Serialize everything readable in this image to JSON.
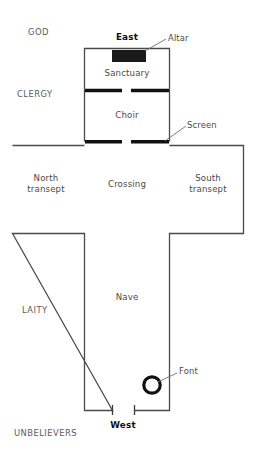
{
  "diagram": {
    "type": "church-floor-plan",
    "title_absent": true,
    "colors": {
      "background": "#ffffff",
      "wall_stroke": "#4a4a4a",
      "solid_fill": "#1a1a1a",
      "text": "#4a4a4a",
      "leader": "#6e6e6e"
    },
    "compass": {
      "east_label": "East",
      "west_label": "West"
    },
    "zones": [
      {
        "id": "god",
        "label": "GOD"
      },
      {
        "id": "clergy",
        "label": "CLERGY"
      },
      {
        "id": "laity",
        "label": "LAITY"
      },
      {
        "id": "unbelievers",
        "label": "UNBELIEVERS"
      }
    ],
    "rooms": [
      {
        "id": "sanctuary",
        "label": "Sanctuary"
      },
      {
        "id": "choir",
        "label": "Choir"
      },
      {
        "id": "crossing",
        "label": "Crossing"
      },
      {
        "id": "north-transept",
        "label_line1": "North",
        "label_line2": "transept"
      },
      {
        "id": "south-transept",
        "label_line1": "South",
        "label_line2": "transept"
      },
      {
        "id": "nave",
        "label": "Nave"
      }
    ],
    "features": [
      {
        "id": "altar",
        "label": "Altar",
        "shape": "filled-rectangle"
      },
      {
        "id": "screen",
        "label": "Screen",
        "shape": "thick-line-with-gap"
      },
      {
        "id": "font",
        "label": "Font",
        "shape": "circle-outline"
      }
    ]
  }
}
